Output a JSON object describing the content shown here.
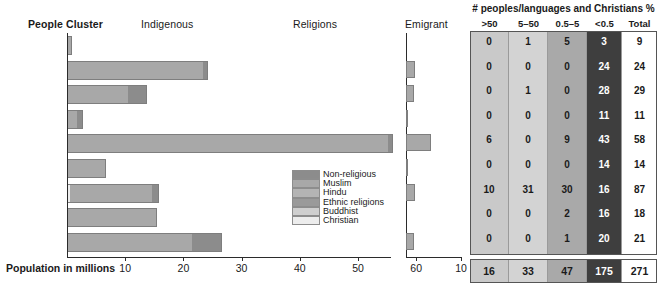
{
  "headers": {
    "people_cluster": "People Cluster",
    "indigenous": "Indigenous",
    "religions": "Religions",
    "emigrant": "Emigrant"
  },
  "axis": {
    "title": "Population in millions",
    "ticks": [
      "10",
      "20",
      "30",
      "40",
      "50",
      "60"
    ],
    "emigrant_ticks": [
      "10"
    ]
  },
  "legend": {
    "items": [
      {
        "label": "Non-religious",
        "color": "#8c8c8c"
      },
      {
        "label": "Muslim",
        "color": "#a8a8a8"
      },
      {
        "label": "Hindu",
        "color": "#b4b4b4"
      },
      {
        "label": "Ethnic religions",
        "color": "#9a9a9a"
      },
      {
        "label": "Buddhist",
        "color": "#cfcfcf"
      },
      {
        "label": "Christian",
        "color": "#ededed"
      }
    ]
  },
  "table": {
    "title": "# peoples/languages and Christians %",
    "columns": [
      ">50",
      "5–50",
      "0.5–5",
      "<0.5",
      "Total"
    ],
    "column_colors": [
      "#c9c9c9",
      "#d3d3d3",
      "#a9a9a9",
      "#3e3e3e",
      "#ffffff"
    ],
    "rows": [
      {
        "cluster": "Altaic",
        "values": [
          "0",
          "1",
          "5",
          "3",
          "9"
        ]
      },
      {
        "cluster": "Azerbaijani",
        "values": [
          "0",
          "0",
          "0",
          "24",
          "24"
        ]
      },
      {
        "cluster": "Kazakh",
        "values": [
          "0",
          "1",
          "0",
          "28",
          "29"
        ]
      },
      {
        "cluster": "Kyrgyz",
        "values": [
          "0",
          "0",
          "0",
          "11",
          "11"
        ]
      },
      {
        "cluster": "Turkish",
        "values": [
          "6",
          "0",
          "9",
          "43",
          "58"
        ]
      },
      {
        "cluster": "Turkmen",
        "values": [
          "0",
          "0",
          "0",
          "14",
          "14"
        ]
      },
      {
        "cluster": "Ural-Siberian",
        "values": [
          "10",
          "31",
          "30",
          "16",
          "87"
        ]
      },
      {
        "cluster": "Uighur",
        "values": [
          "0",
          "0",
          "2",
          "16",
          "18"
        ]
      },
      {
        "cluster": "Uzbek",
        "values": [
          "0",
          "0",
          "1",
          "20",
          "21"
        ]
      }
    ],
    "totals": [
      "16",
      "33",
      "47",
      "175",
      "271"
    ]
  },
  "chart_data": {
    "type": "bar",
    "xlabel": "Population in millions",
    "ylabel": "People Cluster",
    "xlim": [
      0,
      62
    ],
    "emigrant_xlim": [
      0,
      10
    ],
    "grid": false,
    "legend_position": "inside-right",
    "categories": [
      "Altaic",
      "Azerbaijani",
      "Kazakh",
      "Kyrgyz",
      "Turkish",
      "Turkmen",
      "Ural-Siberian",
      "Uighur",
      "Uzbek"
    ],
    "series": [
      {
        "name": "Christian",
        "color": "#ededed",
        "values": [
          0,
          0,
          0,
          0,
          0,
          0,
          0.6,
          0,
          0
        ]
      },
      {
        "name": "Buddhist",
        "color": "#cfcfcf",
        "values": [
          0,
          0,
          0,
          0,
          0,
          0,
          0,
          0,
          0
        ]
      },
      {
        "name": "Muslim",
        "color": "#a8a8a8",
        "values": [
          0.5,
          23.4,
          10.4,
          1.7,
          55.2,
          6.4,
          14.0,
          15.1,
          21.4
        ]
      },
      {
        "name": "Non-religious",
        "color": "#8c8c8c",
        "values": [
          0,
          0.6,
          3.1,
          0.9,
          0.6,
          0,
          1.0,
          0,
          5.0
        ]
      }
    ],
    "indigenous_totals": [
      0.5,
      24.0,
      13.5,
      2.6,
      55.8,
      6.4,
      15.6,
      15.1,
      26.4
    ],
    "emigrant": {
      "name": "Emigrant",
      "color": "#a8a8a8",
      "values": [
        0,
        1.6,
        1.5,
        0.3,
        4.6,
        0.2,
        1.7,
        0,
        1.5
      ]
    }
  }
}
